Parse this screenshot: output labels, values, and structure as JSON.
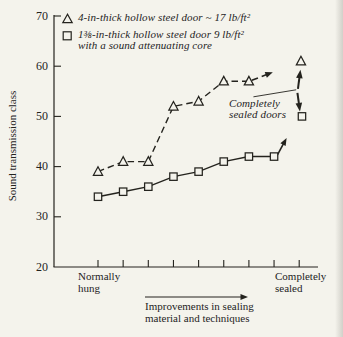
{
  "colors": {
    "paper": "#f4f3ec",
    "ink": "#24231e"
  },
  "legend": {
    "items": [
      {
        "marker": "triangle",
        "lines": [
          "4-in-thick hollow steel door ~ 17 lb/ft²"
        ]
      },
      {
        "marker": "square",
        "lines": [
          "1⅜-in-thick hollow steel door 9 lb/ft²",
          "with a sound attenuating core"
        ]
      }
    ]
  },
  "chart_data": {
    "type": "line",
    "title": "",
    "ylabel": "Sound transmission class",
    "xlabel": "",
    "ylim": [
      20,
      70
    ],
    "yticks": [
      20,
      30,
      40,
      50,
      60,
      70
    ],
    "x_tick_count": 9,
    "grid": false,
    "x_left_label": [
      "Normally",
      "hung"
    ],
    "x_right_label": [
      "Completely",
      "sealed"
    ],
    "x_caption": [
      "Improvements in sealing",
      "material and techniques"
    ],
    "series": [
      {
        "name": "4-in-thick hollow steel door ~ 17 lb/ft²",
        "marker": "triangle",
        "line_style": "dashed",
        "x": [
          1,
          2,
          3,
          4,
          5,
          6,
          7
        ],
        "values": [
          39,
          41,
          41,
          52,
          53,
          57,
          57
        ],
        "end_arrow": {
          "x": 7.95,
          "y": 58.8
        }
      },
      {
        "name": "1⅜-in-thick hollow steel door 9 lb/ft² with a sound attenuating core",
        "marker": "square",
        "line_style": "solid",
        "x": [
          1,
          2,
          3,
          4,
          5,
          6,
          7,
          8
        ],
        "values": [
          34,
          35,
          36,
          38,
          39,
          41,
          42,
          42
        ],
        "end_arrow": {
          "x": 8.5,
          "y": 45.7
        }
      }
    ],
    "sealed_points": [
      {
        "marker": "triangle",
        "x": 9.07,
        "y": 61,
        "arrow": {
          "from": {
            "x": 8.95,
            "y": 55.5
          },
          "to": {
            "x": 9.05,
            "y": 59.3
          }
        }
      },
      {
        "marker": "square",
        "x": 9.11,
        "y": 50,
        "arrow": {
          "from": {
            "x": 8.93,
            "y": 54.7
          },
          "to": {
            "x": 9.03,
            "y": 51.0
          }
        }
      }
    ],
    "annotation": {
      "lines": [
        "Completely",
        "sealed doors"
      ],
      "leader": {
        "from": {
          "x": 7.18,
          "y": 53.9
        },
        "to": {
          "x": 8.88,
          "y": 55.3
        }
      }
    }
  }
}
